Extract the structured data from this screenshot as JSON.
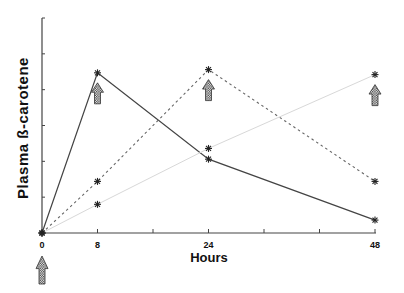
{
  "chart_data": {
    "type": "line",
    "title": "",
    "xlabel": "Hours",
    "ylabel": "Plasma ß-carotene",
    "x": [
      0,
      8,
      24,
      48
    ],
    "x_ticks": [
      0,
      8,
      16,
      24,
      32,
      40,
      48
    ],
    "x_tick_labels": [
      "0",
      "8",
      "",
      "24",
      "",
      "",
      "48"
    ],
    "xlim": [
      0,
      48
    ],
    "y_ticks": [
      0,
      1,
      2,
      3,
      4,
      5,
      6
    ],
    "y_tick_labels": [
      "",
      "",
      "",
      "",
      "",
      "",
      ""
    ],
    "ylim": [
      0,
      6
    ],
    "grid": false,
    "legend": null,
    "series": [
      {
        "name": "solid",
        "style": "solid",
        "color": "#444444",
        "values": [
          0,
          4.47,
          2.06,
          0.36
        ]
      },
      {
        "name": "dashed",
        "style": "dashed",
        "color": "#666666",
        "values": [
          0,
          1.44,
          4.56,
          1.44
        ]
      },
      {
        "name": "light",
        "style": "light-solid",
        "color": "#d8d8d8",
        "values": [
          0,
          0.8,
          2.36,
          4.42
        ]
      }
    ],
    "marker": "asterisk",
    "annotations": [
      {
        "type": "hatched-up-arrow",
        "x": 0,
        "position": "below-axis"
      },
      {
        "type": "hatched-up-arrow",
        "x": 8,
        "below_series": "solid"
      },
      {
        "type": "hatched-up-arrow",
        "x": 24,
        "below_series": "dashed"
      },
      {
        "type": "hatched-up-arrow",
        "x": 48,
        "below_series": "light"
      }
    ]
  }
}
